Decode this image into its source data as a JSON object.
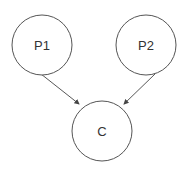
{
  "diagram": {
    "nodes": [
      {
        "id": "P1",
        "label": "P1",
        "cx": 42,
        "cy": 45,
        "r": 30
      },
      {
        "id": "P2",
        "label": "P2",
        "cx": 146,
        "cy": 45,
        "r": 30
      },
      {
        "id": "C",
        "label": "C",
        "cx": 102,
        "cy": 131,
        "r": 30
      }
    ],
    "edges": [
      {
        "from": "P1",
        "to": "C"
      },
      {
        "from": "P2",
        "to": "C"
      }
    ],
    "colors": {
      "stroke": "#555555",
      "text": "#333333",
      "background": "#ffffff"
    }
  }
}
